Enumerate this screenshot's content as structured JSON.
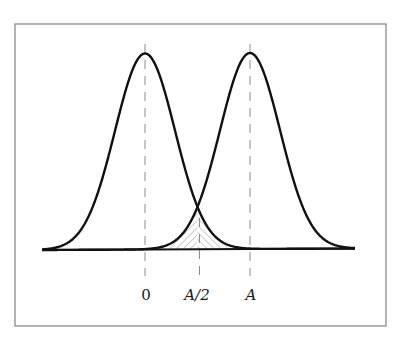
{
  "figure": {
    "colors": {
      "background": "#ffffff",
      "frame": "#8a8a8a",
      "curve": "#111111",
      "dashed_line": "#8c8c8c",
      "hatch": "#9a9a9a",
      "label": "#1a1a1a"
    },
    "axis_labels": [
      {
        "id": "zero",
        "text": "0",
        "italic": false
      },
      {
        "id": "half",
        "text": "A/2",
        "italic": true
      },
      {
        "id": "a",
        "text": "A",
        "italic": true
      }
    ]
  },
  "chart_data": {
    "type": "line",
    "title": "",
    "xlabel": "",
    "ylabel": "",
    "grid": false,
    "legend": null,
    "series": [
      {
        "name": "distribution-centered-0",
        "mean": 0,
        "shape": "gaussian"
      },
      {
        "name": "distribution-centered-A",
        "mean": "A",
        "shape": "gaussian"
      }
    ],
    "x_ticks": [
      "0",
      "A/2",
      "A"
    ],
    "markers": [
      {
        "x": "0",
        "style": "dashed-vertical"
      },
      {
        "x": "A/2",
        "style": "dashed-vertical"
      },
      {
        "x": "A",
        "style": "dashed-vertical"
      }
    ],
    "annotations": [
      {
        "type": "hatched-region",
        "description": "overlap area under both curves around x = A/2 (error region)"
      }
    ]
  }
}
